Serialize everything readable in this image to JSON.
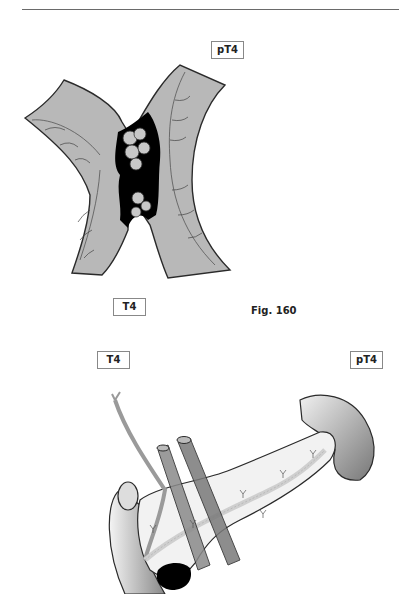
{
  "page": {
    "header_rule": true
  },
  "figure_top": {
    "label_top": "pT4",
    "label_bottom": "T4",
    "caption": "Fig. 160",
    "illustration": "colon-tumor-crossing-illustration"
  },
  "figure_bottom": {
    "label_left": "T4",
    "label_right": "pT4",
    "illustration": "pancreas-tumor-illustration"
  },
  "colors": {
    "tissue_fill": "#b8b8b8",
    "tumor_fill": "#000000",
    "outline": "#2a2a2a",
    "vessel_fill": "#8a8a8a"
  }
}
